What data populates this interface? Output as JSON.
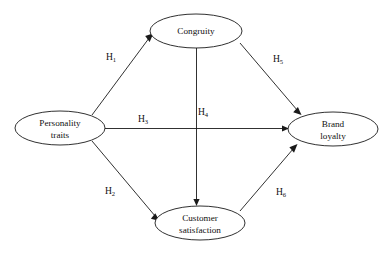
{
  "diagram": {
    "background_color": "#ffffff",
    "line_color": "#1a1a1a",
    "text_color": "#111111",
    "nodes": [
      {
        "id": "congruity",
        "label_lines": [
          "Congruity"
        ],
        "cx": 196,
        "cy": 31,
        "rx": 46,
        "ry": 17
      },
      {
        "id": "personality-traits",
        "label_lines": [
          "Personality",
          "traits"
        ],
        "cx": 60,
        "cy": 128,
        "rx": 45,
        "ry": 17
      },
      {
        "id": "brand-loyalty",
        "label_lines": [
          "Brand",
          "loyalty"
        ],
        "cx": 333,
        "cy": 129,
        "rx": 45,
        "ry": 17
      },
      {
        "id": "customer-satisfaction",
        "label_lines": [
          "Customer",
          "satisfaction"
        ],
        "cx": 200,
        "cy": 223,
        "rx": 45,
        "ry": 17
      }
    ],
    "edges": [
      {
        "id": "h1",
        "label": "H",
        "subscript": "1",
        "from": "personality-traits",
        "to": "congruity",
        "label_x": 111,
        "label_y": 60
      },
      {
        "id": "h2",
        "label": "H",
        "subscript": "2",
        "from": "personality-traits",
        "to": "customer-satisfaction",
        "label_x": 110,
        "label_y": 194
      },
      {
        "id": "h3",
        "label": "H",
        "subscript": "3",
        "from": "personality-traits",
        "to": "brand-loyalty",
        "label_x": 143,
        "label_y": 122
      },
      {
        "id": "h4",
        "label": "H",
        "subscript": "4",
        "from": "congruity",
        "to": "customer-satisfaction",
        "label_x": 203,
        "label_y": 115
      },
      {
        "id": "h5",
        "label": "H",
        "subscript": "5",
        "from": "congruity",
        "to": "brand-loyalty",
        "label_x": 278,
        "label_y": 62
      },
      {
        "id": "h6",
        "label": "H",
        "subscript": "6",
        "from": "customer-satisfaction",
        "to": "brand-loyalty",
        "label_x": 281,
        "label_y": 195
      }
    ]
  }
}
